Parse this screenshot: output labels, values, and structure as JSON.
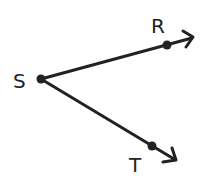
{
  "diagram": {
    "type": "angle",
    "vertex": {
      "label": "S",
      "x": 41,
      "y": 79
    },
    "rays": [
      {
        "name": "ray-SR",
        "point_label": "R",
        "point": {
          "x": 167,
          "y": 45
        },
        "arrow_tip": {
          "x": 193,
          "y": 37
        }
      },
      {
        "name": "ray-ST",
        "point_label": "T",
        "point": {
          "x": 152,
          "y": 146
        },
        "arrow_tip": {
          "x": 175,
          "y": 160
        }
      }
    ],
    "labels": {
      "vertex": "S",
      "r": "R",
      "t": "T"
    },
    "colors": {
      "stroke": "#222222",
      "background": "#ffffff"
    }
  }
}
